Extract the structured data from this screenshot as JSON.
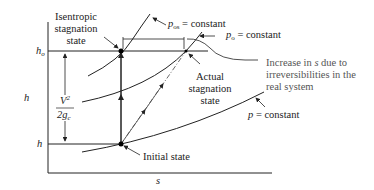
{
  "diagram": {
    "type": "h-s diagram",
    "axes": {
      "x_label": "s",
      "y_label": "h"
    },
    "y_ticks": {
      "h_o": "h",
      "h_o_sub": "o",
      "h": "h"
    },
    "velocity_term": {
      "num": "V",
      "num_sup": "2",
      "den": "2g",
      "den_sub": "c"
    },
    "labels": {
      "isentropic_1": "Isentropic",
      "isentropic_2": "stagnation",
      "isentropic_3": "state",
      "p_os": "p",
      "p_os_sub": "os",
      "p_os_rest": " = constant",
      "p_o": "p",
      "p_o_sub": "o",
      "p_o_rest": " = constant",
      "increase_1": "Increase in ",
      "increase_s": "s",
      "increase_1b": " due to",
      "increase_2": "irreversibilities in the",
      "increase_3": "real system",
      "actual_1": "Actual",
      "actual_2": "stagnation",
      "actual_3": "state",
      "p_const": "p",
      "p_const_rest": " = constant",
      "initial": "Initial state"
    }
  }
}
